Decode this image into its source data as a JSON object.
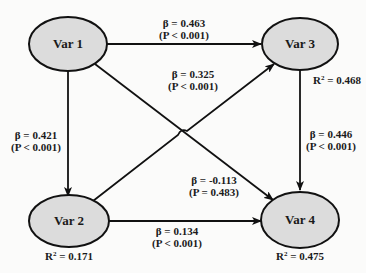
{
  "diagram": {
    "type": "path-model",
    "colors": {
      "node_fill": "#dcdcdc",
      "stroke": "#111111",
      "background": "#fbfbfa"
    },
    "nodes": [
      {
        "id": "var1",
        "label": "Var 1",
        "r2": null
      },
      {
        "id": "var2",
        "label": "Var 2",
        "r2_prefix": "R",
        "r2_sup": "2",
        "r2_value": " = 0.171"
      },
      {
        "id": "var3",
        "label": "Var 3",
        "r2_prefix": "R",
        "r2_sup": "2",
        "r2_value": " = 0.468"
      },
      {
        "id": "var4",
        "label": "Var 4",
        "r2_prefix": "R",
        "r2_sup": "2",
        "r2_value": " = 0.475"
      }
    ],
    "edges": [
      {
        "from": "Var 1",
        "to": "Var 3",
        "beta": "β = 0.463",
        "p": "(P < 0.001)"
      },
      {
        "from": "Var 2",
        "to": "Var 3",
        "beta": "β = 0.325",
        "p": "(P < 0.001)"
      },
      {
        "from": "Var 1",
        "to": "Var 2",
        "beta": "β = 0.421",
        "p": "(P < 0.001)"
      },
      {
        "from": "Var 3",
        "to": "Var 4",
        "beta": "β = 0.446",
        "p": "(P < 0.001)"
      },
      {
        "from": "Var 1",
        "to": "Var 4",
        "beta": "β = -0.113",
        "p": "(P = 0.483)"
      },
      {
        "from": "Var 2",
        "to": "Var 4",
        "beta": "β = 0.134",
        "p": "(P < 0.001)"
      }
    ]
  }
}
